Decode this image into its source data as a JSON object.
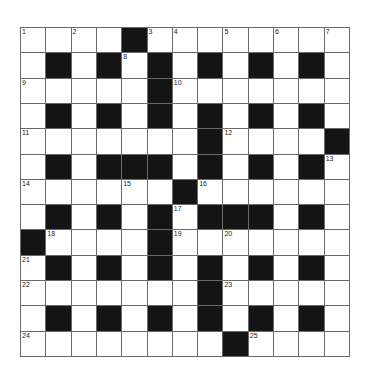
{
  "puzzle": {
    "type": "crossword",
    "size": 13,
    "colors": {
      "black": "#141414",
      "white": "#ffffff",
      "line": "#6a6a6a"
    },
    "rows": [
      "....#........",
      ".#.#.#.#.#.#.",
      ".....#.......",
      ".#.#.#.#.#.#.",
      ".......#....#",
      ".#.###.#.#.#.",
      "......#......",
      ".#.#.#.###.#.",
      "#....#.......",
      ".#.#.#.#.#.#.",
      ".......#.....",
      ".#.#.#.#.#.#.",
      "........#...."
    ],
    "numbers": [
      {
        "r": 0,
        "c": 0,
        "n": "1"
      },
      {
        "r": 0,
        "c": 2,
        "n": "2"
      },
      {
        "r": 0,
        "c": 5,
        "n": "3"
      },
      {
        "r": 0,
        "c": 6,
        "n": "4"
      },
      {
        "r": 0,
        "c": 8,
        "n": "5"
      },
      {
        "r": 0,
        "c": 10,
        "n": "6"
      },
      {
        "r": 0,
        "c": 12,
        "n": "7"
      },
      {
        "r": 1,
        "c": 4,
        "n": "8"
      },
      {
        "r": 2,
        "c": 0,
        "n": "9"
      },
      {
        "r": 2,
        "c": 6,
        "n": "10"
      },
      {
        "r": 4,
        "c": 0,
        "n": "11"
      },
      {
        "r": 4,
        "c": 8,
        "n": "12"
      },
      {
        "r": 5,
        "c": 12,
        "n": "13"
      },
      {
        "r": 6,
        "c": 0,
        "n": "14"
      },
      {
        "r": 6,
        "c": 4,
        "n": "15"
      },
      {
        "r": 6,
        "c": 7,
        "n": "16"
      },
      {
        "r": 7,
        "c": 6,
        "n": "17"
      },
      {
        "r": 8,
        "c": 1,
        "n": "18"
      },
      {
        "r": 8,
        "c": 6,
        "n": "19"
      },
      {
        "r": 8,
        "c": 8,
        "n": "20"
      },
      {
        "r": 9,
        "c": 0,
        "n": "21"
      },
      {
        "r": 10,
        "c": 0,
        "n": "22"
      },
      {
        "r": 10,
        "c": 8,
        "n": "23"
      },
      {
        "r": 12,
        "c": 0,
        "n": "24"
      },
      {
        "r": 12,
        "c": 9,
        "n": "25"
      }
    ]
  }
}
